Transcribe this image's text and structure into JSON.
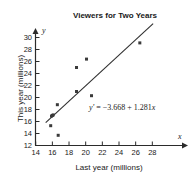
{
  "chart_data": {
    "type": "scatter",
    "title": "Viewers for Two Years",
    "xlabel": "Last year (millions)",
    "ylabel": "This year (millions)",
    "x_axis_symbol": "x",
    "y_axis_symbol": "y",
    "xlim": [
      13.4,
      29.8
    ],
    "ylim": [
      12,
      31
    ],
    "xticks": [
      14,
      16,
      18,
      20,
      22,
      24,
      26,
      28
    ],
    "yticks": [
      12,
      14,
      16,
      18,
      20,
      22,
      24,
      26,
      28,
      30
    ],
    "xtick_labels": [
      "14",
      "16",
      "18",
      "20",
      "22",
      "24",
      "26",
      "28"
    ],
    "ytick_labels": [
      "12",
      "14",
      "16",
      "18",
      "20",
      "22",
      "24",
      "26",
      "28",
      "30"
    ],
    "grid": false,
    "legend": false,
    "points": [
      {
        "x": 15.8,
        "y": 15.3
      },
      {
        "x": 15.9,
        "y": 16.9
      },
      {
        "x": 16.0,
        "y": 17.0
      },
      {
        "x": 16.1,
        "y": 17.1
      },
      {
        "x": 16.6,
        "y": 18.8
      },
      {
        "x": 16.7,
        "y": 13.7
      },
      {
        "x": 18.9,
        "y": 21.0
      },
      {
        "x": 18.9,
        "y": 25.0
      },
      {
        "x": 20.1,
        "y": 26.4
      },
      {
        "x": 20.7,
        "y": 20.3
      },
      {
        "x": 26.5,
        "y": 29.1
      }
    ],
    "trendline": {
      "equation_text": "y' = −3.668 + 1.281x",
      "equation_lhs": "y'",
      "equation_eq": " = ",
      "equation_rhs": "−3.668 + 1.281",
      "equation_var": "x",
      "intercept": -3.668,
      "slope": 1.281,
      "x_start": 15.2,
      "x_end": 28.1
    },
    "marker_color": "#3a3a3a",
    "line_color": "#2f2f2f",
    "axis_color": "#2b2b2b"
  }
}
